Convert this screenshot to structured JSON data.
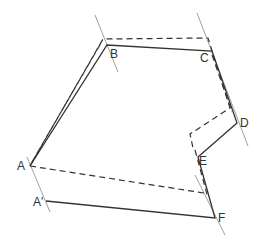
{
  "diagram": {
    "colors": {
      "line": "#333333",
      "guide": "#888888"
    },
    "labels": [
      {
        "id": "A",
        "text": "A",
        "x": 17,
        "y": 160
      },
      {
        "id": "A_prime",
        "text": "A'",
        "x": 33,
        "y": 196
      },
      {
        "id": "B",
        "text": "B",
        "x": 110,
        "y": 48
      },
      {
        "id": "C",
        "text": "C",
        "x": 200,
        "y": 52
      },
      {
        "id": "D",
        "text": "D",
        "x": 240,
        "y": 117
      },
      {
        "id": "E",
        "text": "E",
        "x": 199,
        "y": 155
      },
      {
        "id": "F",
        "text": "F",
        "x": 218,
        "y": 212
      }
    ],
    "solid_path": [
      [
        30,
        166
      ],
      [
        107,
        45
      ],
      [
        212,
        51
      ],
      [
        237,
        123
      ],
      [
        198,
        157
      ],
      [
        215,
        218
      ],
      [
        46,
        201
      ]
    ],
    "dashed_path": [
      [
        30,
        166
      ],
      [
        103,
        39
      ],
      [
        208,
        38
      ],
      [
        230,
        108
      ],
      [
        190,
        134
      ],
      [
        193,
        148
      ]
    ],
    "dashed_extra": [
      [
        [
          30,
          166
        ],
        [
          204,
          193
        ]
      ]
    ],
    "dashed_parallels": [
      [
        [
          32,
          162
        ],
        [
          101,
          43
        ]
      ],
      [
        [
          212,
          55
        ],
        [
          232,
          112
        ]
      ],
      [
        [
          195,
          150
        ],
        [
          208,
          198
        ]
      ]
    ],
    "guide_lines": [
      [
        [
          95,
          15
        ],
        [
          118,
          72
        ]
      ],
      [
        [
          197,
          13
        ],
        [
          248,
          146
        ]
      ],
      [
        [
          27,
          157
        ],
        [
          50,
          212
        ]
      ],
      [
        [
          195,
          175
        ],
        [
          225,
          235
        ]
      ]
    ]
  }
}
